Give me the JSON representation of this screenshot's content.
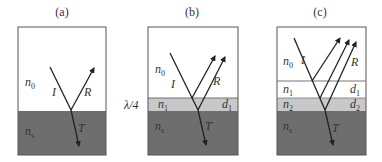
{
  "panels": [
    {
      "caption": "(a)",
      "media": [
        {
          "label": "n",
          "sub": "0",
          "role": "ambient"
        },
        {
          "label": "n",
          "sub": "s",
          "role": "substrate"
        }
      ],
      "rays": {
        "incident": "I",
        "reflected": "R",
        "transmitted": "T"
      }
    },
    {
      "caption": "(b)",
      "side_label": "λ/4",
      "media": [
        {
          "label": "n",
          "sub": "0",
          "role": "ambient"
        },
        {
          "label": "n",
          "sub": "1",
          "role": "layer",
          "thickness_label": "d",
          "thickness_sub": "1"
        },
        {
          "label": "n",
          "sub": "s",
          "role": "substrate"
        }
      ],
      "rays": {
        "incident": "I",
        "reflected": "R",
        "transmitted": "T"
      }
    },
    {
      "caption": "(c)",
      "media": [
        {
          "label": "n",
          "sub": "0",
          "role": "ambient"
        },
        {
          "label": "n",
          "sub": "1",
          "role": "layer",
          "thickness_label": "d",
          "thickness_sub": "1"
        },
        {
          "label": "n",
          "sub": "2",
          "role": "layer",
          "thickness_label": "d",
          "thickness_sub": "2"
        },
        {
          "label": "n",
          "sub": "s",
          "role": "substrate"
        }
      ],
      "rays": {
        "incident": "I",
        "reflected": "R",
        "transmitted": "T"
      }
    }
  ],
  "colors": {
    "ambient": "#ffffff",
    "layer_light": "#c8c8c8",
    "substrate": "#6e6e6e",
    "line": "#2a2a2a",
    "border": "#555555"
  }
}
